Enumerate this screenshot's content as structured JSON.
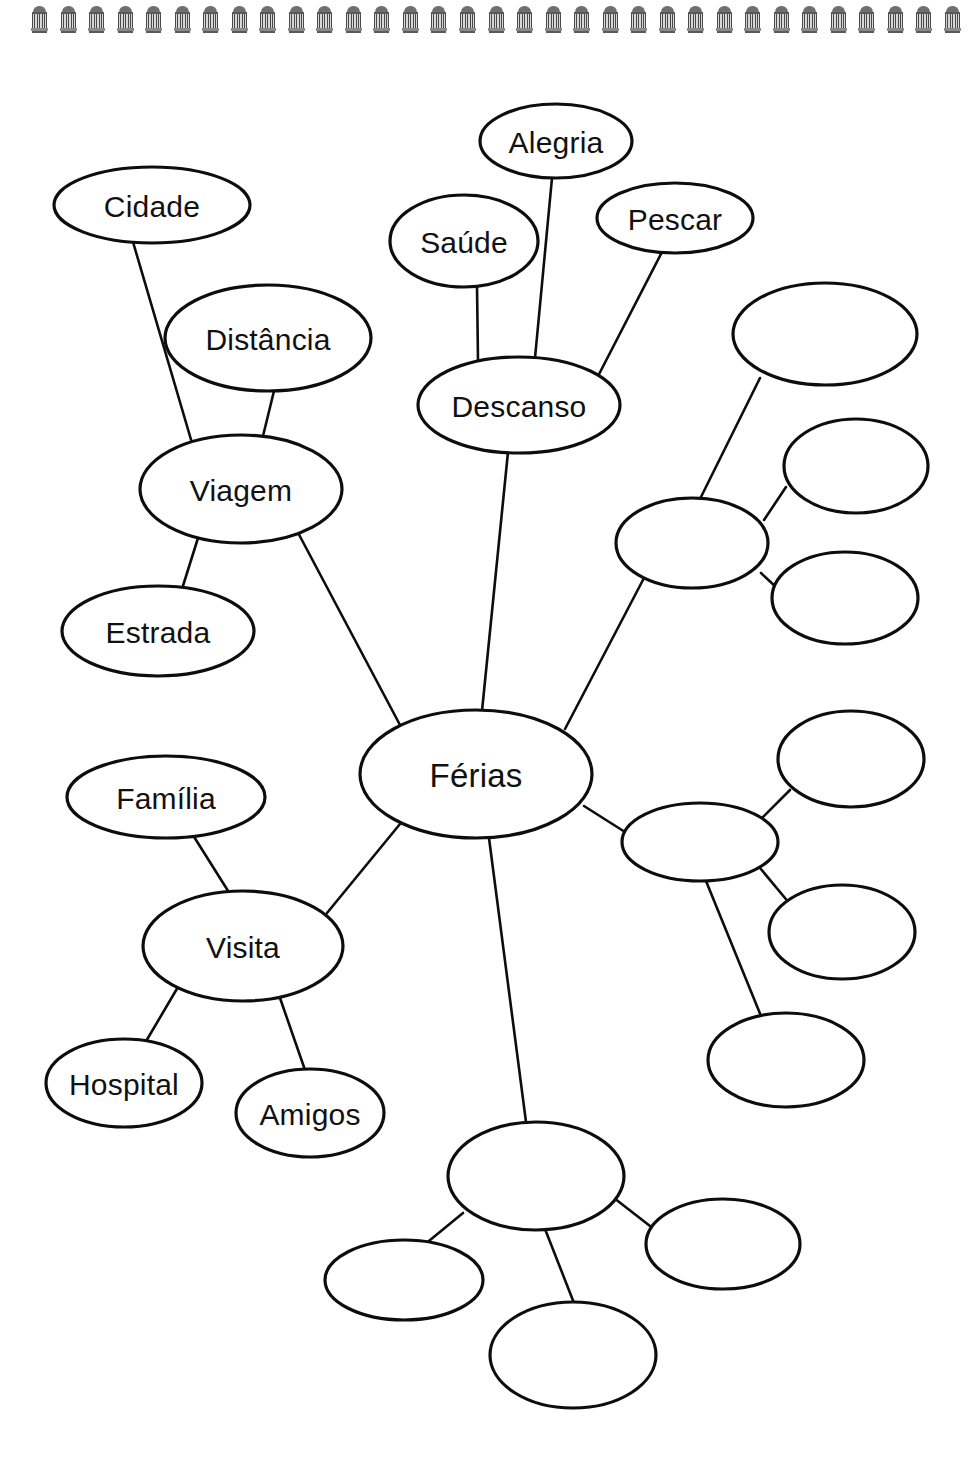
{
  "page": {
    "background_color": "#ffffff",
    "ink_color": "#0d0d0d",
    "binding": {
      "icon": "spiral-binding-ring",
      "ring_count": 33,
      "color": "#4a4a4a"
    }
  },
  "diagram": {
    "type": "mind-map",
    "center_node": "Férias",
    "language": "Portuguese",
    "labeled_node_count": 13,
    "blank_node_count": 11,
    "total_node_count": 24,
    "nodes": [
      {
        "id": "ferias",
        "label": "Férias",
        "cx": 476,
        "cy": 774,
        "rx": 116,
        "ry": 64,
        "blank": false,
        "role": "center"
      },
      {
        "id": "cidade",
        "label": "Cidade",
        "cx": 152,
        "cy": 205,
        "rx": 98,
        "ry": 38,
        "blank": false,
        "role": "leaf"
      },
      {
        "id": "distancia",
        "label": "Distância",
        "cx": 268,
        "cy": 338,
        "rx": 103,
        "ry": 53,
        "blank": false,
        "role": "leaf"
      },
      {
        "id": "viagem",
        "label": "Viagem",
        "cx": 241,
        "cy": 489,
        "rx": 101,
        "ry": 54,
        "blank": false,
        "role": "branch"
      },
      {
        "id": "estrada",
        "label": "Estrada",
        "cx": 158,
        "cy": 631,
        "rx": 96,
        "ry": 45,
        "blank": false,
        "role": "leaf"
      },
      {
        "id": "saude",
        "label": "Saúde",
        "cx": 464,
        "cy": 241,
        "rx": 74,
        "ry": 46,
        "blank": false,
        "role": "leaf"
      },
      {
        "id": "alegria",
        "label": "Alegria",
        "cx": 556,
        "cy": 141,
        "rx": 76,
        "ry": 37,
        "blank": false,
        "role": "leaf"
      },
      {
        "id": "pescar",
        "label": "Pescar",
        "cx": 675,
        "cy": 218,
        "rx": 78,
        "ry": 35,
        "blank": false,
        "role": "leaf"
      },
      {
        "id": "descanso",
        "label": "Descanso",
        "cx": 519,
        "cy": 405,
        "rx": 101,
        "ry": 48,
        "blank": false,
        "role": "branch"
      },
      {
        "id": "familia",
        "label": "Família",
        "cx": 166,
        "cy": 797,
        "rx": 99,
        "ry": 41,
        "blank": false,
        "role": "leaf"
      },
      {
        "id": "visita",
        "label": "Visita",
        "cx": 243,
        "cy": 946,
        "rx": 100,
        "ry": 55,
        "blank": false,
        "role": "branch"
      },
      {
        "id": "hospital",
        "label": "Hospital",
        "cx": 124,
        "cy": 1083,
        "rx": 78,
        "ry": 44,
        "blank": false,
        "role": "leaf"
      },
      {
        "id": "amigos",
        "label": "Amigos",
        "cx": 310,
        "cy": 1113,
        "rx": 74,
        "ry": 44,
        "blank": false,
        "role": "leaf"
      },
      {
        "id": "blank_r1",
        "label": "",
        "cx": 825,
        "cy": 334,
        "rx": 92,
        "ry": 51,
        "blank": true,
        "role": "leaf"
      },
      {
        "id": "blank_r2",
        "label": "",
        "cx": 856,
        "cy": 466,
        "rx": 72,
        "ry": 47,
        "blank": true,
        "role": "leaf"
      },
      {
        "id": "blank_r3",
        "label": "",
        "cx": 692,
        "cy": 543,
        "rx": 76,
        "ry": 45,
        "blank": true,
        "role": "branch"
      },
      {
        "id": "blank_r4",
        "label": "",
        "cx": 845,
        "cy": 598,
        "rx": 73,
        "ry": 46,
        "blank": true,
        "role": "leaf"
      },
      {
        "id": "blank_r5",
        "label": "",
        "cx": 851,
        "cy": 759,
        "rx": 73,
        "ry": 48,
        "blank": true,
        "role": "leaf"
      },
      {
        "id": "blank_r6",
        "label": "",
        "cx": 700,
        "cy": 842,
        "rx": 78,
        "ry": 39,
        "blank": true,
        "role": "branch"
      },
      {
        "id": "blank_r7",
        "label": "",
        "cx": 842,
        "cy": 932,
        "rx": 73,
        "ry": 47,
        "blank": true,
        "role": "leaf"
      },
      {
        "id": "blank_r8",
        "label": "",
        "cx": 786,
        "cy": 1060,
        "rx": 78,
        "ry": 47,
        "blank": true,
        "role": "leaf"
      },
      {
        "id": "blank_b1",
        "label": "",
        "cx": 536,
        "cy": 1176,
        "rx": 88,
        "ry": 54,
        "blank": true,
        "role": "branch"
      },
      {
        "id": "blank_b2",
        "label": "",
        "cx": 404,
        "cy": 1280,
        "rx": 79,
        "ry": 40,
        "blank": true,
        "role": "leaf"
      },
      {
        "id": "blank_b3",
        "label": "",
        "cx": 723,
        "cy": 1244,
        "rx": 77,
        "ry": 45,
        "blank": true,
        "role": "leaf"
      },
      {
        "id": "blank_b4",
        "label": "",
        "cx": 573,
        "cy": 1355,
        "rx": 83,
        "ry": 53,
        "blank": true,
        "role": "leaf"
      }
    ],
    "edges": [
      {
        "from": "cidade",
        "to": "viagem",
        "x1": 133,
        "y1": 242,
        "x2": 192,
        "y2": 443
      },
      {
        "from": "distancia",
        "to": "viagem",
        "x1": 274,
        "y1": 391,
        "x2": 263,
        "y2": 436
      },
      {
        "from": "viagem",
        "to": "estrada",
        "x1": 198,
        "y1": 538,
        "x2": 182,
        "y2": 589
      },
      {
        "from": "viagem",
        "to": "ferias",
        "x1": 295,
        "y1": 527,
        "x2": 400,
        "y2": 725
      },
      {
        "from": "alegria",
        "to": "descanso",
        "x1": 552,
        "y1": 178,
        "x2": 535,
        "y2": 358
      },
      {
        "from": "saude",
        "to": "descanso",
        "x1": 477,
        "y1": 286,
        "x2": 478,
        "y2": 361
      },
      {
        "from": "pescar",
        "to": "descanso",
        "x1": 662,
        "y1": 252,
        "x2": 595,
        "y2": 382
      },
      {
        "from": "descanso",
        "to": "ferias",
        "x1": 508,
        "y1": 452,
        "x2": 482,
        "y2": 711
      },
      {
        "from": "blank_r1",
        "to": "blank_r3",
        "x1": 760,
        "y1": 378,
        "x2": 700,
        "y2": 499
      },
      {
        "from": "blank_r2",
        "to": "blank_r3",
        "x1": 786,
        "y1": 487,
        "x2": 764,
        "y2": 520
      },
      {
        "from": "blank_r3",
        "to": "blank_r4",
        "x1": 761,
        "y1": 573,
        "x2": 777,
        "y2": 588
      },
      {
        "from": "blank_r3",
        "to": "ferias",
        "x1": 644,
        "y1": 578,
        "x2": 565,
        "y2": 729
      },
      {
        "from": "ferias",
        "to": "blank_r6",
        "x1": 584,
        "y1": 806,
        "x2": 625,
        "y2": 832
      },
      {
        "from": "blank_r6",
        "to": "blank_r5",
        "x1": 759,
        "y1": 821,
        "x2": 790,
        "y2": 790
      },
      {
        "from": "blank_r6",
        "to": "blank_r7",
        "x1": 760,
        "y1": 868,
        "x2": 790,
        "y2": 904
      },
      {
        "from": "blank_r6",
        "to": "blank_r8",
        "x1": 706,
        "y1": 881,
        "x2": 761,
        "y2": 1016
      },
      {
        "from": "ferias",
        "to": "blank_b1",
        "x1": 489,
        "y1": 838,
        "x2": 526,
        "y2": 1122
      },
      {
        "from": "blank_b1",
        "to": "blank_b2",
        "x1": 463,
        "y1": 1213,
        "x2": 424,
        "y2": 1245
      },
      {
        "from": "blank_b1",
        "to": "blank_b3",
        "x1": 614,
        "y1": 1198,
        "x2": 659,
        "y2": 1233
      },
      {
        "from": "blank_b1",
        "to": "blank_b4",
        "x1": 545,
        "y1": 1229,
        "x2": 574,
        "y2": 1303
      },
      {
        "from": "familia",
        "to": "visita",
        "x1": 191,
        "y1": 832,
        "x2": 230,
        "y2": 894
      },
      {
        "from": "visita",
        "to": "ferias",
        "x1": 327,
        "y1": 913,
        "x2": 400,
        "y2": 824
      },
      {
        "from": "visita",
        "to": "hospital",
        "x1": 178,
        "y1": 987,
        "x2": 145,
        "y2": 1043
      },
      {
        "from": "visita",
        "to": "amigos",
        "x1": 280,
        "y1": 998,
        "x2": 305,
        "y2": 1070
      }
    ]
  }
}
